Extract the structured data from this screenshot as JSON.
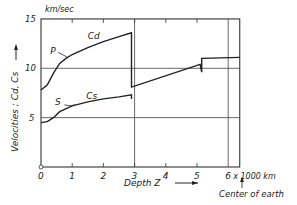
{
  "chart_data": {
    "type": "line",
    "title": "",
    "xlabel": "Depth Z",
    "xunit": "x 1000 km",
    "ylabel": "Velocities ; Cd, Cs",
    "yunit": "km/sec",
    "xlim": [
      0,
      6.37
    ],
    "ylim": [
      0,
      15
    ],
    "x_ticks": [
      "0",
      "1",
      "2",
      "3",
      "4",
      "5",
      "6"
    ],
    "y_ticks": [
      "5",
      "10",
      "15"
    ],
    "grid": {
      "horizontal_lines_at": [
        5,
        10
      ],
      "vertical_lines_at": [
        3,
        6
      ]
    },
    "annotations": {
      "p_label": "P",
      "cd_label": "Cd",
      "s_label": "S",
      "cs_label": "Cs",
      "center": "Center of earth"
    },
    "series": [
      {
        "name": "P (Cd)",
        "points": [
          [
            0,
            7.8
          ],
          [
            0.2,
            8.3
          ],
          [
            0.4,
            9.5
          ],
          [
            0.6,
            10.5
          ],
          [
            0.8,
            11.0
          ],
          [
            1.0,
            11.4
          ],
          [
            1.5,
            12.1
          ],
          [
            2.0,
            12.7
          ],
          [
            2.5,
            13.2
          ],
          [
            2.9,
            13.6
          ],
          [
            2.9,
            8.1
          ],
          [
            5.1,
            10.4
          ],
          [
            5.15,
            9.6
          ],
          [
            5.15,
            11.0
          ],
          [
            6.37,
            11.1
          ]
        ]
      },
      {
        "name": "S (Cs)",
        "points": [
          [
            0,
            4.5
          ],
          [
            0.2,
            4.6
          ],
          [
            0.4,
            5.0
          ],
          [
            0.6,
            5.6
          ],
          [
            1.0,
            6.2
          ],
          [
            1.5,
            6.6
          ],
          [
            2.0,
            6.9
          ],
          [
            2.5,
            7.1
          ],
          [
            2.9,
            7.3
          ],
          [
            2.9,
            6.9
          ]
        ]
      }
    ]
  }
}
